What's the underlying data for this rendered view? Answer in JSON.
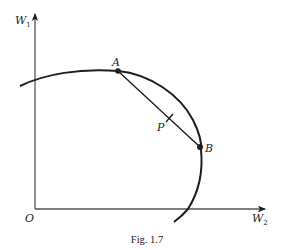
{
  "figure": {
    "caption": "Fig. 1.7",
    "axes": {
      "y_label": "W",
      "y_label_sub": "1",
      "x_label": "W",
      "x_label_sub": "2",
      "origin_label": "O"
    },
    "points": {
      "A": "A",
      "B": "B",
      "P": "P"
    },
    "colors": {
      "ink": "#1e1e1e",
      "background": "#ffffff"
    }
  }
}
